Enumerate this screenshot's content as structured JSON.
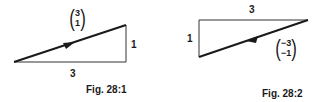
{
  "figures": [
    {
      "caption": "Fig. 28:1",
      "vector": {
        "top": "3",
        "bottom": "1"
      },
      "horizontal_label": "3",
      "vertical_label": "1",
      "arrow_direction": "up-right"
    },
    {
      "caption": "Fig. 28:2",
      "vector": {
        "top": "−3",
        "bottom": "−1"
      },
      "horizontal_label": "3",
      "vertical_label": "1",
      "arrow_direction": "down-left"
    }
  ],
  "colors": {
    "ink": "#1a1a1a",
    "thin_line": "#333333",
    "background": "#ffffff"
  }
}
